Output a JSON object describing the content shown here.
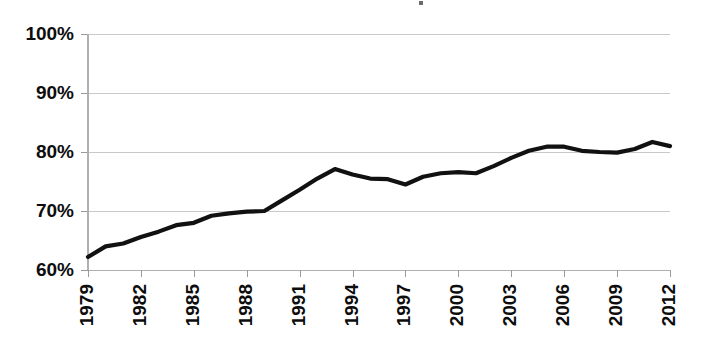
{
  "chart_data": {
    "type": "line",
    "title": "",
    "xlabel": "",
    "ylabel": "",
    "xlim": [
      1979,
      2012
    ],
    "ylim": [
      60,
      100
    ],
    "grid": true,
    "legend": null,
    "y_tick_labels": [
      "100%",
      "90%",
      "80%",
      "70%",
      "60%"
    ],
    "y_tick_values": [
      100,
      90,
      80,
      70,
      60
    ],
    "x_tick_labels": [
      "1979",
      "1982",
      "1985",
      "1988",
      "1991",
      "1994",
      "1997",
      "2000",
      "2003",
      "2006",
      "2009",
      "2012"
    ],
    "x_tick_values": [
      1979,
      1982,
      1985,
      1988,
      1991,
      1994,
      1997,
      2000,
      2003,
      2006,
      2009,
      2012
    ],
    "series": [
      {
        "name": "percent",
        "color": "#111111",
        "x": [
          1979,
          1980,
          1981,
          1982,
          1983,
          1984,
          1985,
          1986,
          1987,
          1988,
          1989,
          1990,
          1991,
          1992,
          1993,
          1994,
          1995,
          1996,
          1997,
          1998,
          1999,
          2000,
          2001,
          2002,
          2003,
          2004,
          2005,
          2006,
          2007,
          2008,
          2009,
          2010,
          2011,
          2012
        ],
        "values": [
          62.2,
          64.0,
          64.5,
          65.6,
          66.5,
          67.6,
          68.0,
          69.2,
          69.6,
          69.9,
          70.0,
          71.8,
          73.6,
          75.5,
          77.1,
          76.2,
          75.5,
          75.4,
          74.5,
          75.8,
          76.4,
          76.6,
          76.4,
          77.6,
          79.0,
          80.2,
          80.9,
          80.9,
          80.2,
          80.0,
          79.9,
          80.5,
          81.7,
          81.0
        ]
      }
    ]
  },
  "axis": {
    "y_axis_name": "vertical-percentage-axis",
    "x_axis_name": "horizontal-year-axis"
  }
}
